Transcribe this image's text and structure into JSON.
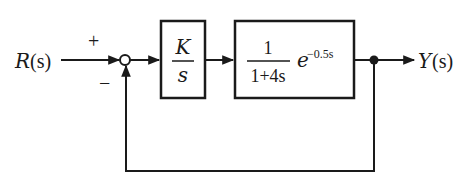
{
  "diagram": {
    "type": "feedback-control-block-diagram",
    "input": {
      "label_var": "R",
      "label_arg": "(s)"
    },
    "output": {
      "label_var": "Y",
      "label_arg": "(s)"
    },
    "summing_junction": {
      "plus_sign": "+",
      "minus_sign": "−"
    },
    "blocks": [
      {
        "id": "controller",
        "numerator": "K",
        "denominator": "s"
      },
      {
        "id": "plant",
        "numerator": "1",
        "denominator": "1+4s",
        "delay_base": "e",
        "delay_exponent": "−0.5s"
      }
    ],
    "feedback": {
      "type": "unity",
      "sign": "negative"
    }
  }
}
